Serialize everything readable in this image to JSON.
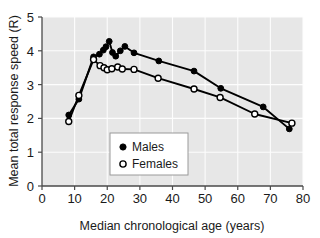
{
  "chart_data": {
    "type": "line",
    "title": "",
    "xlabel": "Median chronological age (years)",
    "ylabel": "Mean total response speed (R)",
    "xlim": [
      0,
      80
    ],
    "ylim": [
      0,
      5
    ],
    "xticks": [
      0,
      10,
      20,
      30,
      40,
      50,
      60,
      70,
      80
    ],
    "yticks": [
      0,
      1,
      2,
      3,
      4,
      5
    ],
    "xtick_labels": [
      "0",
      "10",
      "20",
      "30",
      "40",
      "50",
      "60",
      "70",
      "80"
    ],
    "ytick_labels": [
      "0",
      "1",
      "2",
      "3",
      "4",
      "5"
    ],
    "grid": true,
    "legend_position": "lower-center",
    "series": [
      {
        "name": "Males",
        "marker": "filled-circle",
        "color": "#000000",
        "points": [
          [
            8.2,
            2.1
          ],
          [
            11.3,
            2.57
          ],
          [
            15.8,
            3.82
          ],
          [
            17.6,
            3.9
          ],
          [
            18.8,
            4.02
          ],
          [
            19.6,
            4.12
          ],
          [
            20.6,
            4.28
          ],
          [
            21.6,
            3.95
          ],
          [
            22.6,
            3.84
          ],
          [
            24.0,
            4.0
          ],
          [
            25.4,
            4.13
          ],
          [
            28.2,
            3.94
          ],
          [
            35.8,
            3.7
          ],
          [
            46.6,
            3.4
          ],
          [
            54.8,
            2.89
          ],
          [
            67.8,
            2.34
          ],
          [
            75.8,
            1.69
          ]
        ]
      },
      {
        "name": "Females",
        "marker": "open-circle",
        "color": "#000000",
        "points": [
          [
            8.2,
            1.91
          ],
          [
            11.3,
            2.68
          ],
          [
            15.8,
            3.74
          ],
          [
            17.8,
            3.56
          ],
          [
            19.0,
            3.5
          ],
          [
            20.0,
            3.44
          ],
          [
            21.4,
            3.47
          ],
          [
            23.2,
            3.52
          ],
          [
            24.6,
            3.46
          ],
          [
            28.2,
            3.45
          ],
          [
            35.6,
            3.19
          ],
          [
            46.6,
            2.87
          ],
          [
            54.6,
            2.62
          ],
          [
            65.2,
            2.13
          ],
          [
            76.6,
            1.86
          ]
        ]
      }
    ],
    "legend_entries": [
      {
        "label": "Males",
        "marker": "filled-circle"
      },
      {
        "label": "Females",
        "marker": "open-circle"
      }
    ]
  }
}
